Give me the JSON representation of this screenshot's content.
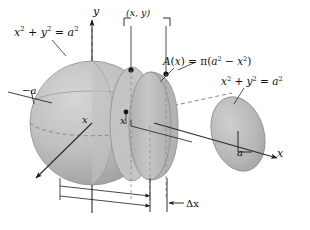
{
  "figure": {
    "background": "#ffffff",
    "width": 310,
    "height": 230,
    "ink_color": "#111111",
    "solid_fill": "#b9b9b9",
    "solid_fill_light": "#c9c9c9",
    "solid_fill_dark": "#a6a6a6",
    "slab_fill": "#bdbdbd",
    "disk_fill": "#b4b4b4",
    "axis_color": "#4a4a4a",
    "dashed_color": "#7a7a7a"
  },
  "labels": {
    "sphere_equation": "x² + y² = a²",
    "area_equation": "A(x) = π(a² − x²)",
    "disk_equation": "x² + y² = a²",
    "point": "(x, y)",
    "y_axis": "y",
    "x_axis": "x",
    "neg_radius": "−a",
    "radius": "a",
    "x_mark_sphere": "x",
    "x_mark_slab": "x",
    "delta_x": "Δx"
  },
  "equation_parts": {
    "sphere": {
      "v1": "x",
      "e1": "2",
      "op1": "+",
      "v2": "y",
      "e2": "2",
      "eq": "=",
      "v3": "a",
      "e3": "2"
    },
    "area": {
      "fn": "A",
      "arg": "x",
      "eq": "=",
      "pi": "π",
      "v1": "a",
      "e1": "2",
      "op": "−",
      "v2": "x",
      "e2": "2"
    },
    "disk": {
      "v1": "x",
      "e1": "2",
      "op1": "+",
      "v2": "y",
      "e2": "2",
      "eq": "=",
      "v3": "a",
      "e3": "2"
    }
  },
  "geometry": {
    "sphere_center": [
      92,
      123
    ],
    "sphere_radius": 62,
    "slab_center": [
      152,
      126
    ],
    "right_disk_center": [
      238,
      134
    ],
    "y_axis_top": [
      92,
      18
    ],
    "x_axis_end": [
      272,
      158
    ],
    "z_axis_end": [
      33,
      180
    ],
    "delta_x_left": 149,
    "delta_x_right": 166
  }
}
